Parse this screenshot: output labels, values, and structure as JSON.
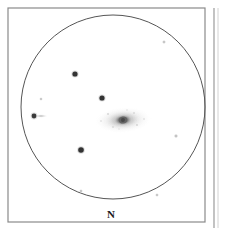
{
  "figure": {
    "kind": "astronomical-eyepiece-sketch",
    "medium": "pencil-drawing",
    "background_color": "#ffffff",
    "width": 228,
    "height": 235
  },
  "frame": {
    "outer_border": {
      "x": 8,
      "y": 8,
      "width": 197,
      "height": 214,
      "stroke_color": "#8a8a8a",
      "stroke_width": 1.2
    },
    "adjacent_panel_edge": {
      "x": 214,
      "y_start": 8,
      "y_end": 228,
      "stroke_color": "#9a9a9a",
      "stroke_width": 1.2
    }
  },
  "field_of_view": {
    "label": "eyepiece-field-circle",
    "center_x": 113,
    "center_y": 107,
    "radius": 92,
    "stroke_color": "#555555",
    "stroke_width": 1.0
  },
  "orientation": {
    "north_label": "N",
    "north_label_x": 111,
    "north_label_y": 216,
    "color": "#1a1a1a"
  },
  "galaxy": {
    "name": "central-galaxy",
    "morphology": "elongated-elliptical-fuzzy-patch",
    "center_x": 123,
    "center_y": 120,
    "halo_rx": 29,
    "halo_ry": 13,
    "halo_rotation_deg": -4,
    "halo_color": "#b9b9b9",
    "mid_rx": 18,
    "mid_ry": 9,
    "mid_color": "#a0a0a0",
    "inner_rx": 10,
    "inner_ry": 6,
    "inner_color": "#8a8a8a",
    "core_rx": 4.5,
    "core_ry": 3.6,
    "core_color": "#5e5e5e",
    "nucleus_r": 2.0,
    "nucleus_color": "#4a4a4a"
  },
  "stars": [
    {
      "id": "star-1",
      "description": "bright-star-upper-left-of-galaxy",
      "x": 102,
      "y": 98,
      "radius": 2.6,
      "color": "#333333",
      "brightness": "bright"
    },
    {
      "id": "star-2",
      "description": "bright-star-upper-field",
      "x": 75,
      "y": 74,
      "radius": 2.6,
      "color": "#333333",
      "brightness": "bright"
    },
    {
      "id": "star-3",
      "description": "bright-star-lower-left-field",
      "x": 81,
      "y": 150,
      "radius": 2.8,
      "color": "#333333",
      "brightness": "bright"
    },
    {
      "id": "star-4",
      "description": "star-with-smear-west-edge",
      "x": 34,
      "y": 116,
      "radius": 2.4,
      "color": "#3a3a3a",
      "brightness": "bright",
      "smear": {
        "x_start": 36,
        "x_end": 47,
        "y": 116,
        "thickness": 1.8,
        "color": "#b0b0b0"
      }
    },
    {
      "id": "star-5",
      "description": "faint-star-upper-left-inside-circle",
      "x": 41,
      "y": 99,
      "radius": 1.0,
      "color": "#c2c2c2",
      "brightness": "faint"
    },
    {
      "id": "star-6",
      "description": "faint-star-upper-right",
      "x": 164,
      "y": 42,
      "radius": 1.1,
      "color": "#bdbdbd",
      "brightness": "faint"
    },
    {
      "id": "star-7",
      "description": "faint-star-east-field",
      "x": 176,
      "y": 136,
      "radius": 1.3,
      "color": "#b5b5b5",
      "brightness": "faint"
    },
    {
      "id": "star-8",
      "description": "faint-star-bottom-left",
      "x": 81,
      "y": 191,
      "radius": 1.1,
      "color": "#c4c4c4",
      "brightness": "faint"
    },
    {
      "id": "star-9",
      "description": "faint-star-bottom-right",
      "x": 157,
      "y": 195,
      "radius": 1.1,
      "color": "#c4c4c4",
      "brightness": "faint"
    }
  ]
}
